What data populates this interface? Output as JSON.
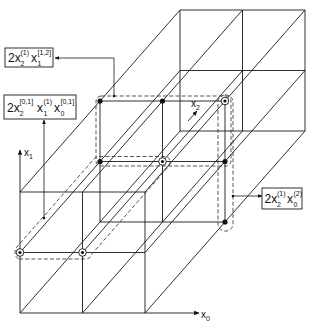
{
  "figure": {
    "colors": {
      "line": "#1a1a1a",
      "background": "#ffffff"
    },
    "axes": {
      "x0": {
        "var": "x",
        "sub": "0"
      },
      "x1": {
        "var": "x",
        "sub": "1"
      },
      "x2": {
        "var": "x",
        "sub": "2"
      }
    },
    "labels": {
      "top_left": {
        "coef": "2",
        "terms": [
          {
            "var": "x",
            "sub": "2",
            "sup": "(1)"
          },
          {
            "var": "x",
            "sub": "1",
            "sup": "[1,2]"
          }
        ]
      },
      "middle_left": {
        "coef": "2",
        "terms": [
          {
            "var": "x",
            "sub": "2",
            "sup": "[0,1]"
          },
          {
            "var": "x",
            "sub": "1",
            "sup": "(1)"
          },
          {
            "var": "x",
            "sub": "0",
            "sup": "[0,1]"
          }
        ]
      },
      "right": {
        "coef": "2",
        "terms": [
          {
            "var": "x",
            "sub": "2",
            "sup": "(1)"
          },
          {
            "var": "x",
            "sub": "0",
            "sup": "(2)"
          }
        ]
      }
    }
  }
}
